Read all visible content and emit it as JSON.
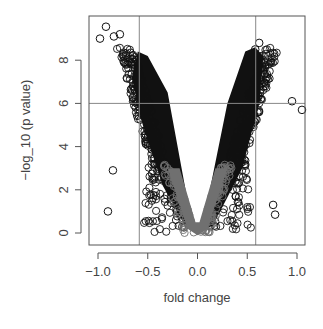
{
  "chart_data": {
    "type": "scatter",
    "title": "",
    "xlabel": "fold change",
    "ylabel": "−log_10 (p value)",
    "xlim": [
      -1.07,
      1.09
    ],
    "ylim": [
      -0.3,
      10.1
    ],
    "x_ticks": [
      -1.0,
      -0.5,
      0.0,
      0.5,
      1.0
    ],
    "x_tick_labels": [
      "−1.0",
      "−0.5",
      "0.0",
      "0.5",
      "1.0"
    ],
    "y_ticks": [
      0,
      2,
      4,
      6,
      8
    ],
    "y_tick_labels": [
      "0",
      "2",
      "4",
      "6",
      "8"
    ],
    "grid": false,
    "reference_lines": {
      "vertical": [
        -0.585,
        0.585
      ],
      "horizontal": [
        6
      ]
    },
    "legend": null,
    "series": [
      {
        "name": "significant",
        "color": "#111111",
        "marker": "open-circle",
        "description": "dense black open circles forming V-shaped volcano arms, |fold change| up to ~1.0, -log10 p up to ~9.6"
      },
      {
        "name": "non-significant",
        "color": "#707070",
        "marker": "open-circle",
        "description": "grey open circles near center, |fold change| < ~0.3, -log10 p < ~3"
      }
    ],
    "notable_points": [
      {
        "x": -0.92,
        "y": 9.55
      },
      {
        "x": -0.98,
        "y": 9.0
      },
      {
        "x": -0.84,
        "y": 9.1
      },
      {
        "x": -0.78,
        "y": 9.2
      },
      {
        "x": 0.58,
        "y": 8.5
      },
      {
        "x": 0.62,
        "y": 8.8
      },
      {
        "x": 0.95,
        "y": 6.1
      },
      {
        "x": 1.05,
        "y": 5.7
      },
      {
        "x": 0.78,
        "y": 0.85
      },
      {
        "x": 0.76,
        "y": 1.3
      },
      {
        "x": -0.85,
        "y": 2.9
      },
      {
        "x": -0.9,
        "y": 1.0
      },
      {
        "x": -0.61,
        "y": 6.0
      }
    ]
  },
  "axes": {
    "x_title": "fold change",
    "y_title": "−log_10 (p value)"
  }
}
